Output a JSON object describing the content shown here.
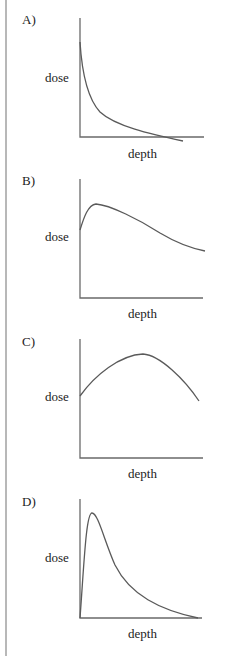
{
  "figure": {
    "panels": [
      {
        "id": "A",
        "label": "A)",
        "ylabel": "dose",
        "xlabel": "depth",
        "curve_shape": "monotonic decay from high surface dose",
        "curve_path": "M80,38 C82,70 88,95 100,108 C115,122 150,130 183,137"
      },
      {
        "id": "B",
        "label": "B)",
        "ylabel": "dose",
        "xlabel": "depth",
        "curve_shape": "buildup to shallow peak then gradual falloff",
        "curve_path": "M80,65 C84,52 88,40 96,39 C110,40 140,55 160,68 C180,80 195,84 205,86"
      },
      {
        "id": "C",
        "label": "C)",
        "ylabel": "dose",
        "xlabel": "depth",
        "curve_shape": "broad peak at mid depth",
        "curve_path": "M80,71 C95,50 120,30 143,29 C160,30 185,55 199,76"
      },
      {
        "id": "D",
        "label": "D)",
        "ylabel": "dose",
        "xlabel": "depth",
        "curve_shape": "zero at surface, sharp peak near surface, long tail",
        "curve_path": "M80,133 C84,80 86,28 92,28 C98,28 104,55 115,80 C130,110 160,125 198,133"
      }
    ]
  }
}
